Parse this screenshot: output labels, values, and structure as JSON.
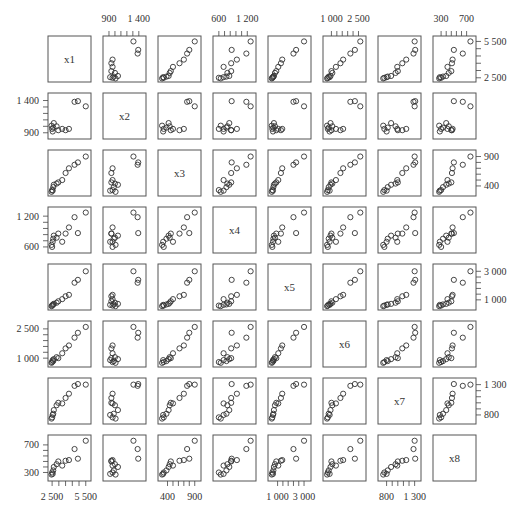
{
  "chart_data": {
    "type": "scatter",
    "subtype": "scatterplot-matrix",
    "title": "",
    "variables": [
      "x1",
      "x2",
      "x3",
      "x4",
      "x5",
      "x6",
      "x7",
      "x8"
    ],
    "axes": {
      "x1": {
        "range": [
          2400,
          5700
        ],
        "ticks": [
          2500,
          5500
        ],
        "tick_labels": [
          "2 500",
          "5 500"
        ]
      },
      "x2": {
        "range": [
          850,
          1470
        ],
        "ticks": [
          900,
          1400
        ],
        "tick_labels": [
          "900",
          "1 400"
        ]
      },
      "x3": {
        "range": [
          280,
          960
        ],
        "ticks": [
          400,
          900
        ],
        "tick_labels": [
          "400",
          "900"
        ]
      },
      "x4": {
        "range": [
          540,
          1320
        ],
        "ticks": [
          600,
          1200
        ],
        "tick_labels": [
          "600",
          "1 200"
        ]
      },
      "x5": {
        "range": [
          500,
          3300
        ],
        "ticks": [
          1000,
          3000
        ],
        "tick_labels": [
          "1 000",
          "3 000"
        ]
      },
      "x6": {
        "range": [
          700,
          2750
        ],
        "ticks": [
          1000,
          2500
        ],
        "tick_labels": [
          "1 000",
          "2 500"
        ]
      },
      "x7": {
        "range": [
          700,
          1360
        ],
        "ticks": [
          800,
          1300
        ],
        "tick_labels": [
          "800",
          "1 300"
        ]
      },
      "x8": {
        "range": [
          220,
          800
        ],
        "ticks": [
          300,
          700
        ],
        "tick_labels": [
          "300",
          "700"
        ]
      }
    },
    "observations": [
      {
        "x1": 2450,
        "x2": 1010,
        "x3": 300,
        "x4": 640,
        "x5": 560,
        "x6": 760,
        "x7": 740,
        "x8": 270
      },
      {
        "x1": 2500,
        "x2": 960,
        "x3": 330,
        "x4": 600,
        "x5": 600,
        "x6": 800,
        "x7": 760,
        "x8": 300
      },
      {
        "x1": 2550,
        "x2": 920,
        "x3": 320,
        "x4": 700,
        "x5": 650,
        "x6": 900,
        "x7": 800,
        "x8": 280
      },
      {
        "x1": 2600,
        "x2": 980,
        "x3": 380,
        "x4": 760,
        "x5": 680,
        "x6": 850,
        "x7": 820,
        "x8": 330
      },
      {
        "x1": 2650,
        "x2": 1050,
        "x3": 420,
        "x4": 820,
        "x5": 720,
        "x6": 950,
        "x7": 880,
        "x8": 380
      },
      {
        "x1": 2900,
        "x2": 1000,
        "x3": 440,
        "x4": 780,
        "x5": 800,
        "x6": 1050,
        "x7": 960,
        "x8": 420
      },
      {
        "x1": 3050,
        "x2": 940,
        "x3": 460,
        "x4": 860,
        "x5": 900,
        "x6": 1000,
        "x7": 1000,
        "x8": 460
      },
      {
        "x1": 3400,
        "x2": 960,
        "x3": 500,
        "x4": 700,
        "x5": 1050,
        "x6": 1250,
        "x7": 990,
        "x8": 400
      },
      {
        "x1": 3700,
        "x2": 940,
        "x3": 620,
        "x4": 860,
        "x5": 1250,
        "x6": 1500,
        "x7": 1080,
        "x8": 470
      },
      {
        "x1": 4000,
        "x2": 960,
        "x3": 700,
        "x4": 980,
        "x5": 1350,
        "x6": 1650,
        "x7": 1150,
        "x8": 480
      },
      {
        "x1": 4500,
        "x2": 1380,
        "x3": 760,
        "x4": 1180,
        "x5": 2200,
        "x6": 2050,
        "x7": 1280,
        "x8": 640
      },
      {
        "x1": 4800,
        "x2": 1390,
        "x3": 800,
        "x4": 870,
        "x5": 2400,
        "x6": 2300,
        "x7": 1310,
        "x8": 500
      },
      {
        "x1": 5500,
        "x2": 1310,
        "x3": 900,
        "x4": 1270,
        "x5": 3000,
        "x6": 2600,
        "x7": 1300,
        "x8": 760
      }
    ],
    "top_axis_labels": [
      {
        "col": 1,
        "labels": [
          "900",
          "1 400"
        ]
      },
      {
        "col": 3,
        "labels": [
          "600",
          "1 200"
        ]
      },
      {
        "col": 5,
        "labels": [
          "1 000",
          "2 500"
        ]
      },
      {
        "col": 7,
        "labels": [
          "300",
          "700"
        ]
      }
    ],
    "right_axis_labels": [
      {
        "row": 0,
        "labels": [
          "5 500",
          "2 500"
        ]
      },
      {
        "row": 2,
        "labels": [
          "900",
          "400"
        ]
      },
      {
        "row": 4,
        "labels": [
          "3 000",
          "1 000"
        ]
      },
      {
        "row": 6,
        "labels": [
          "1 300",
          "800"
        ]
      }
    ],
    "left_axis_labels": [
      {
        "row": 1,
        "labels": [
          "1 400",
          "900"
        ]
      },
      {
        "row": 3,
        "labels": [
          "1 200",
          "600"
        ]
      },
      {
        "row": 5,
        "labels": [
          "2 500",
          "1 000"
        ]
      },
      {
        "row": 7,
        "labels": [
          "700",
          "300"
        ]
      }
    ],
    "bottom_axis_labels": [
      {
        "col": 0,
        "labels": [
          "2 500",
          "5 500"
        ]
      },
      {
        "col": 2,
        "labels": [
          "400",
          "900"
        ]
      },
      {
        "col": 4,
        "labels": [
          "1 000",
          "3 000"
        ]
      },
      {
        "col": 6,
        "labels": [
          "800",
          "1 300"
        ]
      }
    ],
    "marker": "open-circle",
    "grid": false,
    "legend": null
  }
}
